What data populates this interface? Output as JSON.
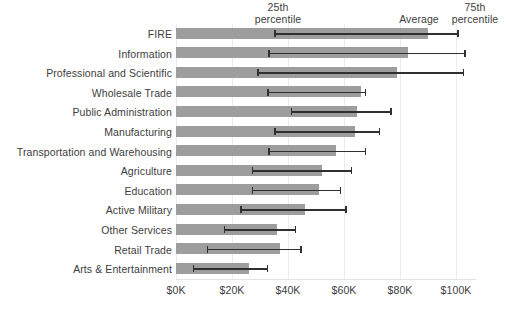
{
  "chart_data": {
    "type": "bar",
    "title": "",
    "subtitle": "",
    "xlabel": "",
    "ylabel": "",
    "orientation": "horizontal",
    "xlim": [
      0,
      100000
    ],
    "xticks": [
      0,
      20000,
      40000,
      60000,
      80000,
      100000
    ],
    "xtick_labels": [
      "$0K",
      "$20K",
      "$40K",
      "$60K",
      "$80K",
      "$100K"
    ],
    "grid": "vertical-light",
    "legend": "none",
    "bar_color": "#9d9d9d",
    "errorbar_color": "#2f2f2f",
    "annotations": [
      {
        "name": "25th percentile",
        "text": "25th\npercentile",
        "points_to": "left whisker cap"
      },
      {
        "name": "Average",
        "text": "Average",
        "points_to": "bar end"
      },
      {
        "name": "75th percentile",
        "text": "75th\npercentile",
        "points_to": "right whisker cap"
      }
    ],
    "categories": [
      "FIRE",
      "Information",
      "Professional and Scientific",
      "Wholesale Trade",
      "Public Administration",
      "Manufacturing",
      "Transportation and Warehousing",
      "Agriculture",
      "Education",
      "Active Military",
      "Other Services",
      "Retail Trade",
      "Arts & Entertainment"
    ],
    "series": [
      {
        "name": "Average",
        "values": [
          90000,
          83000,
          79000,
          66000,
          64500,
          64000,
          57000,
          52000,
          51000,
          46000,
          36000,
          37000,
          26000
        ]
      },
      {
        "name": "25th percentile",
        "values": [
          35000,
          33000,
          29000,
          32500,
          41000,
          35000,
          33000,
          27000,
          27000,
          23000,
          17000,
          11000,
          6000
        ]
      },
      {
        "name": "75th percentile",
        "values": [
          101000,
          103500,
          103000,
          68000,
          77000,
          73000,
          68000,
          63000,
          59000,
          61000,
          43000,
          45000,
          33000
        ]
      }
    ]
  }
}
